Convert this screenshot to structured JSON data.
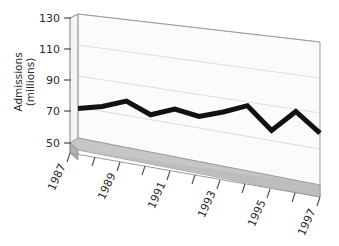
{
  "chart_data": {
    "type": "line",
    "title": "",
    "subtitle": "",
    "xlabel": "",
    "ylabel": "Admissions (millions)",
    "ylabel_lines": [
      "Admissions",
      "(millions)"
    ],
    "ylim": [
      50,
      130
    ],
    "ytick_labels": [
      "130",
      "110",
      "90",
      "70",
      "50"
    ],
    "yticks": [
      130,
      110,
      90,
      70,
      50
    ],
    "xlim": [
      1987,
      1997
    ],
    "xtick_labels": [
      "1987",
      "1989",
      "1991",
      "1993",
      "1995",
      "1997"
    ],
    "xticks": [
      1987,
      1989,
      1991,
      1993,
      1995,
      1997
    ],
    "x": [
      1987,
      1988,
      1989,
      1990,
      1991,
      1992,
      1993,
      1994,
      1995,
      1996,
      1997
    ],
    "values": [
      69,
      73,
      79,
      73,
      79,
      77,
      82,
      88,
      76,
      89,
      79
    ],
    "series": [
      {
        "name": "Admissions",
        "values": [
          69,
          73,
          79,
          73,
          79,
          77,
          82,
          88,
          76,
          89,
          79
        ]
      }
    ],
    "grid": true,
    "grid_orientation": "horizontal",
    "legend": "none",
    "three_d": true,
    "colors": {
      "line": "#111111",
      "back_wall": "#fbfbfb",
      "side_wall": "#f4f4f4",
      "floor_top": "#c6c6c6",
      "floor_front": "#b3b3b3",
      "gridline": "#d8d8d8",
      "frame": "#9a9a9a",
      "text": "#2b2b2b"
    }
  }
}
